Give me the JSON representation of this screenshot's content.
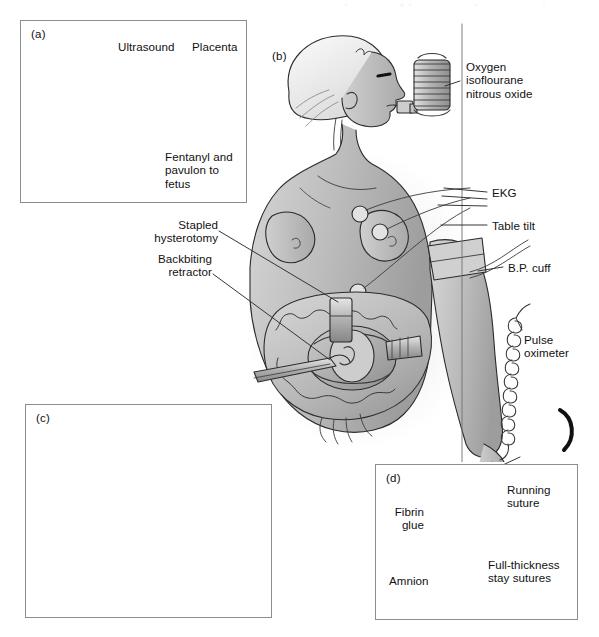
{
  "figure": {
    "background_color": "#ffffff",
    "ink_color": "#111111",
    "frame_color": "#8d8d90",
    "fill_light": "#d8d8d8",
    "fill_mid": "#b9b9b9",
    "fill_dark": "#9a9a9a",
    "fill_darkest": "#7a7a7a"
  },
  "panels": [
    {
      "id": "a",
      "tag": "(a)",
      "caption": "Ultrasound guided intramuscular fetal injection through the uterine wall",
      "labels": [
        {
          "name": "ultrasound",
          "text": "Ultrasound"
        },
        {
          "name": "placenta",
          "text": "Placenta"
        },
        {
          "name": "fentanyl",
          "text": "Fentanyl and\npavulon to\nfetus"
        }
      ]
    },
    {
      "id": "b",
      "tag": "(b)",
      "caption": "Maternal positioning, monitoring and exposed hysterotomy",
      "labels": [
        {
          "name": "anesthetic-gases",
          "text": "Oxygen\nisoflourane\nnitrous oxide"
        },
        {
          "name": "ekg",
          "text": "EKG"
        },
        {
          "name": "table-tilt",
          "text": "Table tilt"
        },
        {
          "name": "bp-cuff",
          "text": "B.P. cuff"
        },
        {
          "name": "pulse-oximeter",
          "text": "Pulse\noximeter"
        },
        {
          "name": "stapled-hysterotomy",
          "text": "Stapled\nhysterotomy"
        },
        {
          "name": "backbiting-retractor",
          "text": "Backbiting\nretractor"
        }
      ]
    },
    {
      "id": "c",
      "tag": "(c)",
      "caption": "Fetus exposed through the hysterotomy with retractors and cannula in place",
      "labels": []
    },
    {
      "id": "d",
      "tag": "(d)",
      "caption": "Closure of the hysterotomy",
      "labels": [
        {
          "name": "fibrin-glue",
          "text": "Fibrin\nglue"
        },
        {
          "name": "amnion",
          "text": "Amnion"
        },
        {
          "name": "running-suture",
          "text": "Running\nsuture"
        },
        {
          "name": "stay-sutures",
          "text": "Full-thickness\nstay sutures"
        }
      ]
    }
  ]
}
